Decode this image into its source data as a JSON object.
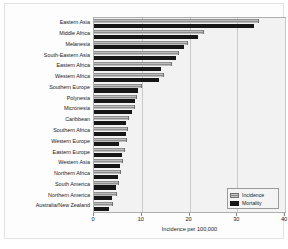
{
  "chart_data": {
    "type": "bar",
    "orientation": "horizontal",
    "title": "",
    "xlabel": "Incidence per 100,000",
    "ylabel": "",
    "xlim": [
      0,
      40
    ],
    "xticks": [
      0,
      10,
      20,
      30,
      40
    ],
    "grid": true,
    "legend_position": "lower-right",
    "categories": [
      "Eastern Asia",
      "Middle Africa",
      "Melanesia",
      "South-Eastern Asia",
      "Eastern Africa",
      "Western Africa",
      "Southern Europe",
      "Polynesia",
      "Micronesia",
      "Caribbean",
      "Southern Africa",
      "Western Europe",
      "Eastern Europe",
      "Western Asia",
      "Northern Africa",
      "South America",
      "Northern America",
      "Australia/New Zealand"
    ],
    "series": [
      {
        "name": "Incidence",
        "color": "#a9a9a9",
        "values": [
          34.6,
          23.0,
          19.7,
          17.9,
          16.4,
          14.6,
          10.0,
          9.1,
          8.6,
          7.4,
          7.1,
          6.9,
          6.5,
          6.0,
          5.6,
          5.2,
          4.8,
          4.0
        ]
      },
      {
        "name": "Mortality",
        "color": "#171717",
        "values": [
          33.6,
          21.8,
          18.9,
          17.1,
          14.0,
          13.7,
          9.3,
          8.6,
          7.9,
          6.8,
          6.6,
          5.2,
          5.8,
          5.4,
          5.1,
          4.7,
          3.7,
          3.1
        ]
      }
    ]
  },
  "legend": {
    "items": [
      {
        "label": "Incidence"
      },
      {
        "label": "Mortality"
      }
    ]
  },
  "axis": {
    "tick_labels": [
      "0",
      "10",
      "20",
      "30",
      "40"
    ],
    "x_title": "Incidence per 100,000"
  }
}
